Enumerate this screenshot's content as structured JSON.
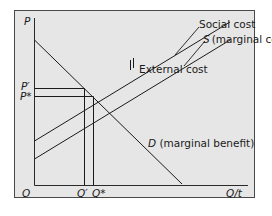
{
  "diagram": {
    "type": "economics-externality",
    "background_color": "#e6e6e6",
    "line_color": "#1a1a1a",
    "axes": {
      "y_label": "P",
      "x_label": "Q/t",
      "origin_label": "O"
    },
    "price_labels": {
      "p_prime": "P′",
      "p_star": "P*"
    },
    "quantity_labels": {
      "q_prime": "Q′",
      "q_star": "Q*"
    },
    "curves": {
      "social_cost": "Social cost",
      "supply": "S (marginal cost)",
      "external_cost": "External cost",
      "demand_prefix": "D",
      "demand_suffix": " (marginal benefit)"
    }
  }
}
